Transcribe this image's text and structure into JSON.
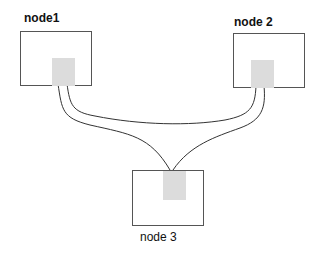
{
  "nodes": [
    {
      "id": "node1",
      "label": "node1"
    },
    {
      "id": "node2",
      "label": "node 2"
    },
    {
      "id": "node3",
      "label": "node 3"
    }
  ],
  "edges": [
    {
      "from": "node1",
      "to": "node2"
    },
    {
      "from": "node1",
      "to": "node3"
    },
    {
      "from": "node2",
      "to": "node3"
    }
  ],
  "colors": {
    "box_border": "#555555",
    "port_fill": "#dcdcdc",
    "wire": "#333333"
  }
}
